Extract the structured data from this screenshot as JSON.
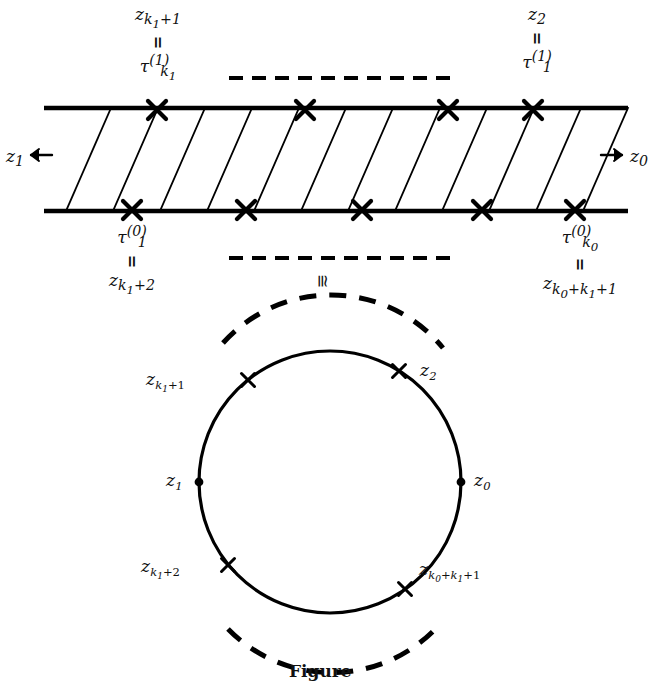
{
  "figure": {
    "caption": "Figure"
  },
  "colors": {
    "ink": "#111111",
    "background": "#ffffff",
    "stroke": "#000000"
  },
  "strip": {
    "label_top_left": {
      "upper": "z_{k_1+1}",
      "relation": "=",
      "lower": "τ^{(1)}_{k_1}"
    },
    "label_top_right": {
      "upper": "z_2",
      "relation": "=",
      "lower": "τ^{(1)}_1"
    },
    "label_bottom_left": {
      "upper": "τ^{(0)}_1",
      "relation": "=",
      "lower": "z_{k_1+2}"
    },
    "label_bottom_right": {
      "upper": "τ^{(0)}_{k_0}",
      "relation": "=",
      "lower": "z_{k_0+k_1+1}"
    },
    "left_arrow_label": "z_1",
    "right_arrow_label": "z_0",
    "left_arrow_icon": "arrow-left-icon",
    "right_arrow_icon": "arrow-right-icon",
    "congruence_symbol": "≅",
    "top_dashes_count": 11,
    "bottom_dashes_count": 11,
    "top_marker_count": 4,
    "bottom_marker_count": 5,
    "slant_line_count": 12,
    "marker_icon": "cross-marker-icon"
  },
  "circle": {
    "points": [
      {
        "id": "z0",
        "label": "z_0",
        "marker": "dot-marker-icon",
        "angle_deg": 0
      },
      {
        "id": "z1",
        "label": "z_1",
        "marker": "dot-marker-icon",
        "angle_deg": 180
      },
      {
        "id": "z2",
        "label": "z_2",
        "marker": "cross-marker-icon",
        "angle_deg": 58
      },
      {
        "id": "zk1p1",
        "label": "z_{k_1+1}",
        "marker": "cross-marker-icon",
        "angle_deg": 129
      },
      {
        "id": "zk1p2",
        "label": "z_{k_1+2}",
        "marker": "cross-marker-icon",
        "angle_deg": 219
      },
      {
        "id": "zk0k1p1",
        "label": "z_{k_0+k_1+1}",
        "marker": "cross-marker-icon",
        "angle_deg": 305
      }
    ],
    "dashed_arc_top": "upper dashed arc",
    "dashed_arc_bottom": "lower dashed arc"
  }
}
